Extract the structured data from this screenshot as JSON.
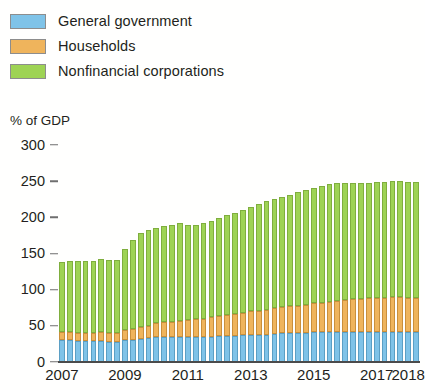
{
  "legend": {
    "items": [
      {
        "label": "General government",
        "color": "#7FC3E8",
        "key": "general_government"
      },
      {
        "label": "Households",
        "color": "#EFB45C",
        "key": "households"
      },
      {
        "label": "Nonfinancial corporations",
        "color": "#9ED354",
        "key": "nonfinancial_corporations"
      }
    ]
  },
  "axis": {
    "y_title": "% of GDP",
    "y_ticks": [
      "0",
      "50",
      "100",
      "150",
      "200",
      "250",
      "300"
    ],
    "x_ticks": [
      "2007",
      "2009",
      "2011",
      "2013",
      "2015",
      "2017",
      "2018"
    ]
  },
  "chart_data": {
    "type": "bar",
    "stacked": true,
    "title": "",
    "subtitle": "",
    "xlabel": "",
    "ylabel": "% of GDP",
    "ylim": [
      0,
      300
    ],
    "ytick_values": [
      0,
      50,
      100,
      150,
      200,
      250,
      300
    ],
    "grid": false,
    "legend_position": "top-left",
    "x_tick_labels": [
      "2007",
      "2009",
      "2011",
      "2013",
      "2015",
      "2017",
      "2018"
    ],
    "x_tick_periods": [
      "2007Q1",
      "2009Q1",
      "2011Q1",
      "2013Q1",
      "2015Q1",
      "2017Q1",
      "2018Q1"
    ],
    "categories": [
      "2007Q1",
      "2007Q2",
      "2007Q3",
      "2007Q4",
      "2008Q1",
      "2008Q2",
      "2008Q3",
      "2008Q4",
      "2009Q1",
      "2009Q2",
      "2009Q3",
      "2009Q4",
      "2010Q1",
      "2010Q2",
      "2010Q3",
      "2010Q4",
      "2011Q1",
      "2011Q2",
      "2011Q3",
      "2011Q4",
      "2012Q1",
      "2012Q2",
      "2012Q3",
      "2012Q4",
      "2013Q1",
      "2013Q2",
      "2013Q3",
      "2013Q4",
      "2014Q1",
      "2014Q2",
      "2014Q3",
      "2014Q4",
      "2015Q1",
      "2015Q2",
      "2015Q3",
      "2015Q4",
      "2016Q1",
      "2016Q2",
      "2016Q3",
      "2016Q4",
      "2017Q1",
      "2017Q2",
      "2017Q3",
      "2017Q4",
      "2018Q1",
      "2018Q2"
    ],
    "series": [
      {
        "name": "General government",
        "color": "#7FC3E8",
        "values": [
          30,
          30,
          29,
          29,
          29,
          29,
          28,
          28,
          30,
          31,
          32,
          33,
          34,
          34,
          34,
          34,
          34,
          34,
          34,
          35,
          36,
          36,
          36,
          37,
          38,
          38,
          38,
          39,
          40,
          40,
          40,
          40,
          41,
          41,
          41,
          41,
          42,
          42,
          42,
          42,
          42,
          42,
          42,
          42,
          42,
          42
        ]
      },
      {
        "name": "Households",
        "color": "#EFB45C",
        "values": [
          11,
          11,
          11,
          11,
          11,
          12,
          12,
          12,
          14,
          15,
          16,
          17,
          20,
          21,
          22,
          23,
          24,
          25,
          26,
          27,
          28,
          29,
          30,
          31,
          32,
          33,
          34,
          35,
          36,
          37,
          38,
          39,
          40,
          41,
          42,
          43,
          44,
          45,
          45,
          46,
          47,
          47,
          48,
          48,
          47,
          47
        ]
      },
      {
        "name": "Nonfinancial corporations",
        "color": "#9ED354",
        "values": [
          97,
          98,
          99,
          99,
          100,
          101,
          101,
          101,
          112,
          123,
          130,
          133,
          131,
          133,
          134,
          135,
          131,
          131,
          132,
          133,
          135,
          138,
          140,
          142,
          145,
          148,
          150,
          151,
          152,
          154,
          157,
          159,
          160,
          162,
          163,
          163,
          162,
          161,
          161,
          160,
          160,
          160,
          160,
          160,
          160,
          160
        ]
      }
    ],
    "totals": [
      138,
      139,
      139,
      139,
      140,
      142,
      141,
      141,
      156,
      169,
      178,
      183,
      185,
      188,
      190,
      192,
      189,
      190,
      192,
      195,
      199,
      203,
      206,
      210,
      215,
      219,
      222,
      225,
      228,
      231,
      235,
      238,
      241,
      244,
      246,
      247,
      248,
      248,
      248,
      248,
      249,
      249,
      250,
      250,
      249,
      249
    ]
  }
}
